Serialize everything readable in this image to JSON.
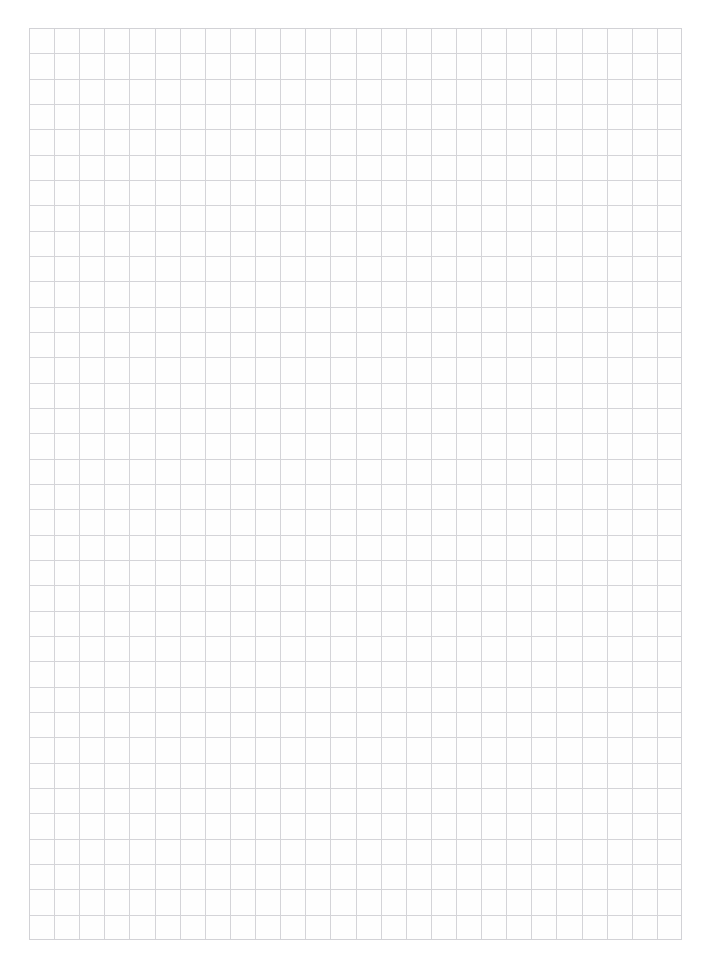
{
  "page": {
    "width": 705,
    "height": 961,
    "background_color": "#ffffff"
  },
  "sheet": {
    "name": "graph-paper-grid",
    "paper_color": "#fefefe",
    "origin_x": 29,
    "origin_y": 28,
    "width": 653,
    "height": 912,
    "columns": 26,
    "rows": 36,
    "cell_width": 25.1,
    "cell_height": 25.3,
    "line_color": "#d4d4d8",
    "line_width": 1,
    "border_color": "#d2d2d6",
    "content": "",
    "annotations": []
  },
  "margins": {
    "top": 28,
    "bottom": 21,
    "left": 29,
    "right": 23,
    "color": "#ffffff"
  }
}
